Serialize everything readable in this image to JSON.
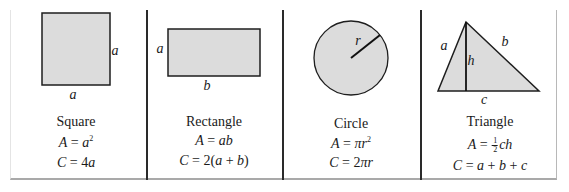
{
  "figure": {
    "cells": [
      {
        "name": "Square",
        "labels": {
          "side_right": "a",
          "side_bottom": "a"
        },
        "area": {
          "lhs": "A",
          "eq": " = ",
          "var": "a",
          "exp": "2"
        },
        "circumference": {
          "lhs": "C",
          "eq": " = ",
          "rhs_plain": "4",
          "rhs_var": "a"
        }
      },
      {
        "name": "Rectangle",
        "labels": {
          "side_left": "a",
          "side_bottom": "b"
        },
        "area": {
          "lhs": "A",
          "eq": " = ",
          "rhs": "ab"
        },
        "circumference": {
          "lhs": "C",
          "eq": " = ",
          "rhs_prefix": "2(",
          "a": "a",
          "plus": " + ",
          "b": "b",
          "rhs_suffix": ")"
        }
      },
      {
        "name": "Circle",
        "labels": {
          "radius": "r"
        },
        "area": {
          "lhs": "A",
          "eq": " = ",
          "rhs": "πr",
          "exp": "2"
        },
        "circumference": {
          "lhs": "C",
          "eq": " = ",
          "rhs_plain": "2",
          "rhs_var": "πr"
        }
      },
      {
        "name": "Triangle",
        "labels": {
          "side_a": "a",
          "side_b": "b",
          "height": "h",
          "base": "c"
        },
        "area": {
          "lhs": "A",
          "eq": " = ",
          "frac_num": "1",
          "frac_den": "2",
          "rhs": "ch"
        },
        "circumference": {
          "lhs": "C",
          "eq": " = ",
          "a": "a",
          "plus1": " + ",
          "b": "b",
          "plus2": " + ",
          "c": "c"
        }
      }
    ],
    "colors": {
      "fill": "#dcdcdc",
      "stroke": "#1e1e1e",
      "divider": "#2a2a2a"
    }
  }
}
